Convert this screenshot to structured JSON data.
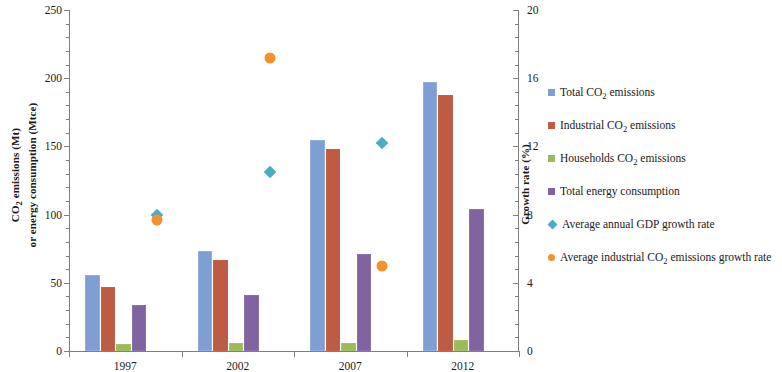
{
  "chart_data": {
    "type": "bar",
    "title": "",
    "xlabel": "",
    "ylabel": "CO2 emissions (Mt) or energy consumption (Mtce)",
    "y2label": "Growth rate (%)",
    "categories": [
      "1997",
      "2002",
      "2007",
      "2012"
    ],
    "ylim": [
      0,
      250
    ],
    "y2lim": [
      0,
      20
    ],
    "yticks": [
      0,
      50,
      100,
      150,
      200,
      250
    ],
    "y2ticks": [
      0,
      4,
      8,
      12,
      16,
      20
    ],
    "grid": false,
    "legend_position": "right",
    "series": [
      {
        "name": "Total CO2 emissions",
        "type": "bar",
        "axis": "left",
        "color": "#7f9fd4",
        "values": [
          56,
          73,
          155,
          197
        ]
      },
      {
        "name": "Industrial CO2 emissions",
        "type": "bar",
        "axis": "left",
        "color": "#bf5a43",
        "values": [
          47,
          67,
          148,
          188
        ]
      },
      {
        "name": "Households CO2 emissions",
        "type": "bar",
        "axis": "left",
        "color": "#9bbb59",
        "values": [
          5,
          6,
          6,
          8
        ]
      },
      {
        "name": "Total energy consumption",
        "type": "bar",
        "axis": "left",
        "color": "#8064a2",
        "values": [
          34,
          41,
          71,
          104
        ]
      },
      {
        "name": "Average annual GDP growth rate",
        "type": "scatter",
        "axis": "right",
        "color": "#4bacc6",
        "values": [
          8.0,
          10.5,
          12.2,
          null
        ]
      },
      {
        "name": "Average industrial CO2 emissions growth rate",
        "type": "scatter",
        "axis": "right",
        "color": "#f3912c",
        "values": [
          7.7,
          17.2,
          5.0,
          null
        ]
      }
    ]
  },
  "axes": {
    "left": {
      "title_line1": "CO",
      "title_sub1": "2",
      "title_line1b": " emissions (Mt)",
      "title_line2": "or energy consumption (Mtce)",
      "ticks": [
        "0",
        "50",
        "100",
        "150",
        "200",
        "250"
      ]
    },
    "right": {
      "title": "Growth rate (%)",
      "ticks": [
        "0",
        "4",
        "8",
        "12",
        "16",
        "20"
      ]
    },
    "x": {
      "ticks": [
        "1997",
        "2002",
        "2007",
        "2012"
      ]
    }
  },
  "legend": {
    "items": [
      {
        "label_pre": "Total CO",
        "sub": "2",
        "label_post": " emissions",
        "marker": "square",
        "color": "#7f9fd4",
        "name": "total-co2-emissions"
      },
      {
        "label_pre": "Industrial CO",
        "sub": "2",
        "label_post": " emissions",
        "marker": "square",
        "color": "#bf5a43",
        "name": "industrial-co2-emissions"
      },
      {
        "label_pre": "Households CO",
        "sub": "2",
        "label_post": " emissions",
        "marker": "square",
        "color": "#9bbb59",
        "name": "households-co2-emissions"
      },
      {
        "label_pre": "Total energy consumption",
        "sub": "",
        "label_post": "",
        "marker": "square",
        "color": "#8064a2",
        "name": "total-energy-consumption"
      },
      {
        "label_pre": "Average annual GDP growth rate",
        "sub": "",
        "label_post": "",
        "marker": "diamond",
        "color": "#4bacc6",
        "name": "average-annual-gdp-growth-rate"
      },
      {
        "label_pre": "Average industrial CO",
        "sub": "2",
        "label_post": " emissions growth rate",
        "marker": "circle",
        "color": "#f3912c",
        "name": "average-industrial-co2-emissions-growth-rate"
      }
    ]
  }
}
